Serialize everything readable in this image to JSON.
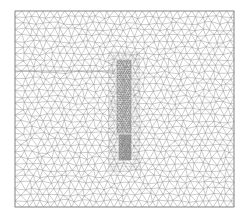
{
  "figure": {
    "type": "triangular-mesh",
    "width": 248,
    "height": 219,
    "background": "#ffffff",
    "line_color": "#8a8a8a",
    "dense_color": "#555555",
    "domain_rect": {
      "x0": 15,
      "y0": 11,
      "x1": 234,
      "y1": 207
    },
    "coarse_spacing": 7,
    "split_line_y": 71,
    "split_line_x_end": 115,
    "refinement": {
      "upper_band": {
        "x0": 117,
        "x1": 131,
        "y0": 60,
        "y1": 135,
        "spacing": 2.2
      },
      "lower_blob": {
        "x0": 119,
        "x1": 131,
        "y0": 135,
        "y1": 160,
        "spacing": 1.6
      },
      "transition_radius": 22
    }
  }
}
